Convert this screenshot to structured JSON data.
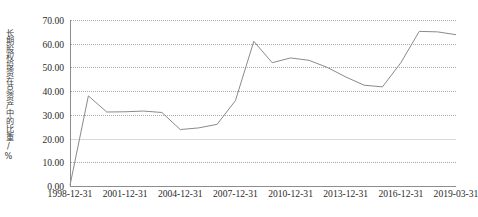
{
  "chart_data": {
    "type": "line",
    "title": "",
    "xlabel": "",
    "ylabel": "长期股权投资在总资产中的比重/%",
    "ylim": [
      0,
      70
    ],
    "ytick_labels": [
      "0.00",
      "10.00",
      "20.00",
      "30.00",
      "40.00",
      "50.00",
      "60.00",
      "70.00"
    ],
    "ytick_values": [
      0,
      10,
      20,
      30,
      40,
      50,
      60,
      70
    ],
    "xtick_labels": [
      "1998-12-31",
      "2001-12-31",
      "2004-12-31",
      "2007-12-31",
      "2010-12-31",
      "2013-12-31",
      "2016-12-31",
      "2019-03-31"
    ],
    "grid": true,
    "legend": "none",
    "x": [
      "1998-12-31",
      "1999-12-31",
      "2000-12-31",
      "2001-12-31",
      "2002-12-31",
      "2003-12-31",
      "2004-12-31",
      "2005-12-31",
      "2006-12-31",
      "2007-12-31",
      "2008-12-31",
      "2009-12-31",
      "2010-12-31",
      "2011-12-31",
      "2012-12-31",
      "2013-12-31",
      "2014-12-31",
      "2015-12-31",
      "2016-12-31",
      "2017-12-31",
      "2018-12-31",
      "2019-03-31"
    ],
    "values": [
      0.3,
      38.0,
      31.2,
      31.3,
      31.6,
      31.0,
      23.8,
      24.5,
      26.0,
      36.0,
      61.0,
      52.0,
      54.0,
      53.0,
      50.0,
      46.0,
      42.5,
      41.8,
      52.0,
      65.2,
      65.0,
      63.8
    ],
    "series_color": "#8a8a8a",
    "grid_color": "#a9a9a9",
    "axis_color": "#8d8d8d"
  }
}
